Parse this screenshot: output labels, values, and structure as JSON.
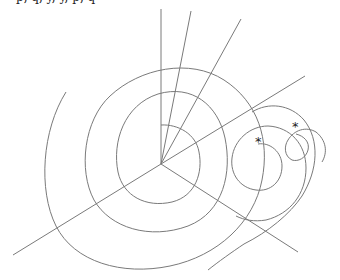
{
  "caption": "p, q, y, y, p, q",
  "diagram": {
    "center": [
      161,
      164
    ],
    "rays": [
      {
        "to": [
          161,
          9
        ]
      },
      {
        "to": [
          191,
          11
        ]
      },
      {
        "to": [
          241,
          19
        ]
      },
      {
        "to": [
          305,
          76
        ]
      },
      {
        "to": [
          13,
          255
        ]
      },
      {
        "to": [
          298,
          252
        ]
      }
    ],
    "markers": [
      {
        "label": "*",
        "x": 256,
        "y": 143
      },
      {
        "label": "*",
        "x": 293,
        "y": 128
      }
    ]
  }
}
